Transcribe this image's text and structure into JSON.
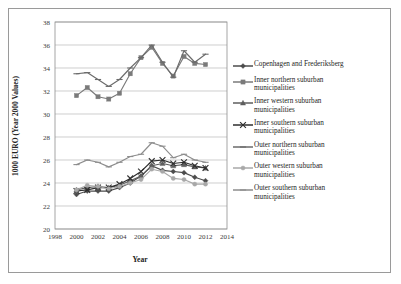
{
  "chart_data": {
    "type": "line",
    "title": "",
    "xlabel": "Year",
    "ylabel": "1000 EURO (Year 2000 Values)",
    "xlim": [
      1998,
      2014
    ],
    "ylim": [
      20,
      38
    ],
    "xticks": [
      1998,
      2000,
      2002,
      2004,
      2006,
      2008,
      2010,
      2012,
      2014
    ],
    "yticks": [
      20,
      22,
      24,
      26,
      28,
      30,
      32,
      34,
      36,
      38
    ],
    "grid": "horizontal",
    "legend_position": "right",
    "x": [
      2000,
      2001,
      2002,
      2003,
      2004,
      2005,
      2006,
      2007,
      2008,
      2009,
      2010,
      2011,
      2012
    ],
    "series": [
      {
        "name": "Copenhagen and Frederiksberg",
        "marker": "diamond",
        "color": "#4c4c4c",
        "values": [
          23.0,
          23.3,
          23.3,
          23.3,
          23.6,
          24.0,
          24.6,
          25.5,
          25.1,
          25.0,
          24.9,
          24.5,
          24.2
        ]
      },
      {
        "name": "Inner northern suburban municipalities",
        "marker": "square",
        "color": "#7a7a7a",
        "values": [
          31.6,
          32.3,
          31.5,
          31.3,
          31.8,
          33.5,
          34.9,
          35.8,
          34.4,
          33.3,
          35.0,
          34.4,
          34.3
        ]
      },
      {
        "name": "Inner western suburban municipalities",
        "marker": "triangle",
        "color": "#5e5e5e",
        "values": [
          23.4,
          23.6,
          23.7,
          23.6,
          23.8,
          24.2,
          24.6,
          25.5,
          25.7,
          25.5,
          25.6,
          25.4,
          25.3
        ]
      },
      {
        "name": "Inner southern suburban municipalities",
        "marker": "cross",
        "color": "#2e2e2e",
        "values": [
          23.3,
          23.4,
          23.6,
          23.6,
          23.9,
          24.4,
          25.0,
          25.9,
          26.0,
          25.7,
          25.8,
          25.5,
          25.3
        ]
      },
      {
        "name": "Outer northern suburban municipalities",
        "marker": "dash",
        "color": "#6b6b6b",
        "values": [
          33.5,
          33.6,
          33.0,
          32.4,
          33.0,
          34.0,
          34.9,
          36.0,
          34.5,
          33.2,
          35.5,
          34.5,
          35.2
        ]
      },
      {
        "name": "Outer western suburban municipalities",
        "marker": "circle",
        "color": "#a8a8a8",
        "values": [
          23.4,
          23.8,
          23.7,
          23.5,
          23.7,
          24.0,
          24.3,
          25.2,
          25.0,
          24.4,
          24.3,
          23.9,
          23.9
        ]
      },
      {
        "name": "Outer southern suburban municipalities",
        "marker": "dash",
        "color": "#8d8d8d",
        "values": [
          25.6,
          26.0,
          25.8,
          25.4,
          25.8,
          26.3,
          26.5,
          27.5,
          27.2,
          26.2,
          26.5,
          26.0,
          25.8
        ]
      }
    ]
  },
  "legend": {
    "items": [
      {
        "label": "Copenhagen and Frederiksberg"
      },
      {
        "label": "Inner northern suburban\nmunicipalities"
      },
      {
        "label": "Inner western suburban\nmunicipalities"
      },
      {
        "label": "Inner southern suburban\nmunicipalities"
      },
      {
        "label": "Outer northern suburban\nmunicipalities"
      },
      {
        "label": "Outer western suburban\nmunicipalities"
      },
      {
        "label": "Outer southern suburban\nmunicipalities"
      }
    ]
  }
}
